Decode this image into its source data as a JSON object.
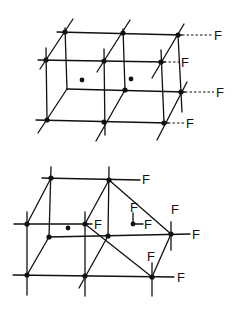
{
  "figure_top": {
    "title": "Lattice cell with surface fluorine labels",
    "labels": [
      "F",
      "F",
      "F",
      "F"
    ],
    "nodes": [
      [
        65,
        32
      ],
      [
        123,
        33
      ],
      [
        178,
        35
      ],
      [
        46,
        60
      ],
      [
        104,
        61
      ],
      [
        161,
        62
      ],
      [
        125,
        90
      ],
      [
        181,
        92
      ],
      [
        47,
        120
      ],
      [
        104,
        122
      ],
      [
        164,
        123
      ]
    ],
    "center_dots": [
      [
        82,
        80
      ],
      [
        131,
        79
      ]
    ]
  },
  "figure_bottom": {
    "title": "Distorted lattice cell with fluorine substituents",
    "labels": [
      "F",
      "F",
      "F",
      "F",
      "F",
      "F",
      "F",
      "F",
      "F"
    ],
    "nodes": [
      [
        51,
        178
      ],
      [
        109,
        180
      ],
      [
        27,
        224
      ],
      [
        85,
        224
      ],
      [
        49,
        237
      ],
      [
        108,
        236
      ],
      [
        171,
        234
      ],
      [
        27,
        275
      ],
      [
        85,
        276
      ],
      [
        152,
        277
      ]
    ],
    "interior_dots": [
      [
        68,
        228
      ],
      [
        133,
        224
      ]
    ]
  }
}
